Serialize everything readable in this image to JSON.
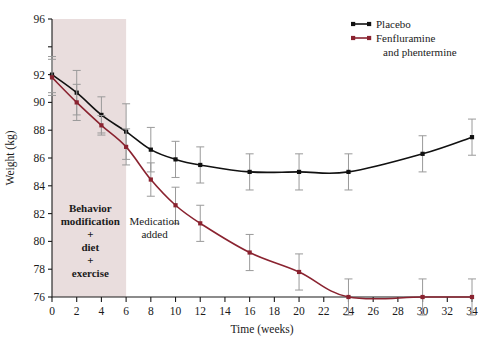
{
  "chart_data": {
    "type": "line",
    "title": "",
    "xlabel": "Time (weeks)",
    "ylabel": "Weight (kg)",
    "xlim": [
      0,
      34
    ],
    "ylim": [
      76,
      96
    ],
    "xticks": [
      0,
      2,
      4,
      6,
      8,
      10,
      12,
      14,
      16,
      18,
      20,
      22,
      24,
      26,
      28,
      30,
      32,
      34
    ],
    "xticklabels": [
      "0",
      "2",
      "4",
      "6",
      "8",
      "10",
      "12",
      "14",
      "16",
      "18",
      "20",
      "22",
      "24",
      "26",
      "28",
      "30",
      "32",
      "34"
    ],
    "yticks": [
      76,
      78,
      80,
      82,
      84,
      86,
      88,
      90,
      92,
      94,
      96
    ],
    "yticklabels": [
      "76",
      "78",
      "80",
      "82",
      "84",
      "86",
      "88",
      "90",
      "92",
      "",
      "96"
    ],
    "grid": false,
    "legend_position": "top-right",
    "series": [
      {
        "name": "Placebo",
        "color": "#111111",
        "x": [
          0,
          2,
          4,
          6,
          8,
          10,
          12,
          16,
          20,
          24,
          30,
          34
        ],
        "values": [
          92.0,
          90.7,
          89.1,
          87.9,
          86.6,
          85.9,
          85.5,
          85.0,
          85.0,
          85.0,
          86.3,
          87.5
        ],
        "errors": [
          1.3,
          1.6,
          1.3,
          2.0,
          1.6,
          1.3,
          1.3,
          1.3,
          1.3,
          1.3,
          1.3,
          1.3
        ]
      },
      {
        "name": "Fenfluramine and phentermine",
        "color": "#8a2330",
        "x": [
          0,
          2,
          4,
          6,
          8,
          10,
          12,
          16,
          20,
          24,
          30,
          34
        ],
        "values": [
          91.8,
          90.0,
          88.35,
          86.8,
          84.45,
          82.6,
          81.3,
          79.2,
          77.8,
          76.0,
          76.0,
          76.0
        ],
        "errors": [
          1.3,
          1.3,
          0.7,
          1.3,
          1.2,
          1.3,
          1.3,
          1.3,
          1.3,
          1.3,
          1.3,
          1.3
        ]
      }
    ],
    "shaded_region": {
      "x_start": 0,
      "x_end": 6,
      "color": "#e9dddd"
    },
    "annotations": [
      {
        "name": "behavior-modification",
        "lines": [
          "Behavior",
          "modification",
          "+",
          "diet",
          "+",
          "exercise"
        ],
        "x": 3.1,
        "y_top": 82.1,
        "bold": true
      },
      {
        "name": "medication-added",
        "lines": [
          "Medication",
          "added"
        ],
        "x": 8.3,
        "y_top": 81.2,
        "bold": false
      }
    ],
    "error_bar_color": "#9a9a9a"
  },
  "legend": {
    "items": [
      {
        "label": "Placebo",
        "color": "#111111"
      },
      {
        "label": "Fenfluramine",
        "color": "#8a2330"
      },
      {
        "label": "and phentermine",
        "color": "#8a2330"
      }
    ]
  }
}
